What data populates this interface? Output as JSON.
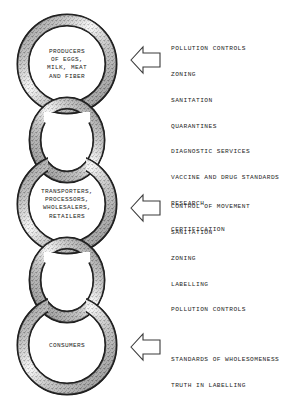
{
  "diagram": {
    "type": "chain-links-with-arrows",
    "background_color": "#ffffff",
    "ink_color": "#1a1a1a"
  },
  "chain": {
    "links": [
      {
        "id": "producers",
        "kind": "labeled-ring",
        "label_lines": [
          "PRODUCERS",
          "OF EGGS,",
          "MILK, MEAT",
          "AND FIBER"
        ],
        "label_text": "PRODUCERS\nOF EGGS,\nMILK, MEAT\nAND FIBER"
      },
      {
        "id": "connector-upper",
        "kind": "connector-ring",
        "label_lines": [],
        "label_text": ""
      },
      {
        "id": "middlemen",
        "kind": "labeled-ring",
        "label_lines": [
          "TRANSPORTERS,",
          "PROCESSORS,",
          "WHOLESALERS,",
          "RETAILERS"
        ],
        "label_text": "TRANSPORTERS,\nPROCESSORS,\nWHOLESALERS,\nRETAILERS"
      },
      {
        "id": "connector-lower",
        "kind": "connector-ring",
        "label_lines": [],
        "label_text": ""
      },
      {
        "id": "consumers",
        "kind": "labeled-ring",
        "label_lines": [
          "CONSUMERS"
        ],
        "label_text": "CONSUMERS"
      }
    ]
  },
  "callouts": [
    {
      "id": "producers-functions",
      "arrow_icon": "arrow-left-icon",
      "arrow_direction": "left",
      "items": [
        "POLLUTION CONTROLS",
        "ZONING",
        "SANITATION",
        "QUARANTINES",
        "DIAGNOSTIC SERVICES",
        "VACCINE AND DRUG STANDARDS",
        "RESEARCH",
        "CERTIFICATION"
      ]
    },
    {
      "id": "middlemen-functions",
      "arrow_icon": "arrow-left-icon",
      "arrow_direction": "left",
      "items": [
        "CONTROL OF MOVEMENT",
        "SANITATION",
        "ZONING",
        "LABELLING",
        "POLLUTION CONTROLS"
      ]
    },
    {
      "id": "consumers-functions",
      "arrow_icon": "arrow-left-icon",
      "arrow_direction": "left",
      "items": [
        "STANDARDS OF WHOLESOMENESS",
        "TRUTH IN LABELLING"
      ]
    }
  ]
}
